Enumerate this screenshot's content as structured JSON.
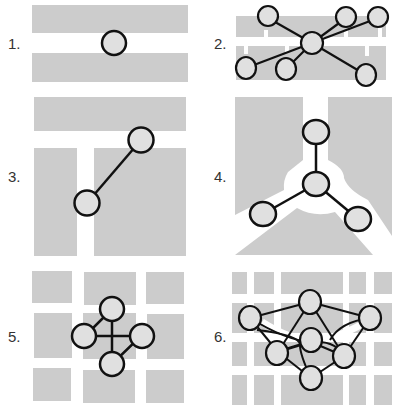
{
  "figure": {
    "colors": {
      "block": "#cccccc",
      "node_fill": "#e0e0e0",
      "stroke": "#111111",
      "background": "#ffffff",
      "label": "#333333"
    },
    "panels": [
      {
        "id": 1,
        "label": "1.",
        "description": "single node in gap between two horizontal blocks"
      },
      {
        "id": 2,
        "label": "2.",
        "description": "hub node with six spokes across a split horizontal band"
      },
      {
        "id": 3,
        "label": "3.",
        "description": "two nodes connected diagonally across a T-shaped gap"
      },
      {
        "id": 4,
        "label": "4.",
        "description": "three-way junction with central node and three leaves"
      },
      {
        "id": 5,
        "label": "5.",
        "description": "four nodes in a diamond ring at grid intersection"
      },
      {
        "id": 6,
        "label": "6.",
        "description": "seven-node mesh network over a dense grid"
      }
    ]
  }
}
